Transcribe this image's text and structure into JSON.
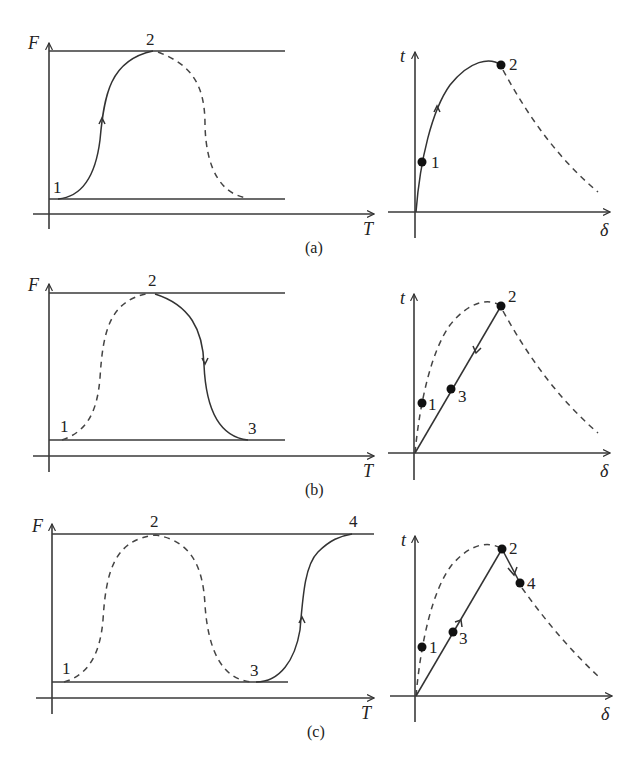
{
  "figure": {
    "panels": [
      {
        "id": "a",
        "caption": "(a)",
        "left_plot": {
          "y_axis_label": "F",
          "x_axis_label": "T",
          "points": [
            "1",
            "2"
          ],
          "solid_path": "1→2 (rising)",
          "dashed_path": "2→falling"
        },
        "right_plot": {
          "y_axis_label": "t",
          "x_axis_label": "δ",
          "points": [
            "1",
            "2"
          ]
        }
      },
      {
        "id": "b",
        "caption": "(b)",
        "left_plot": {
          "y_axis_label": "F",
          "x_axis_label": "T",
          "points": [
            "1",
            "2",
            "3"
          ],
          "solid_path": "2→3 (falling)",
          "dashed_path": "1→2"
        },
        "right_plot": {
          "y_axis_label": "t",
          "x_axis_label": "δ",
          "points": [
            "1",
            "2",
            "3"
          ]
        }
      },
      {
        "id": "c",
        "caption": "(c)",
        "left_plot": {
          "y_axis_label": "F",
          "x_axis_label": "T",
          "points": [
            "1",
            "2",
            "3",
            "4"
          ],
          "solid_path": "3→4 (rising)",
          "dashed_path": "1→2→3"
        },
        "right_plot": {
          "y_axis_label": "t",
          "x_axis_label": "δ",
          "points": [
            "1",
            "2",
            "3",
            "4"
          ]
        }
      }
    ],
    "labels": {
      "F": "F",
      "T": "T",
      "t": "t",
      "delta": "δ",
      "p1": "1",
      "p2": "2",
      "p3": "3",
      "p4": "4",
      "cap_a": "(a)",
      "cap_b": "(b)",
      "cap_c": "(c)"
    },
    "colors": {
      "ink": "#333333",
      "background": "#ffffff"
    }
  }
}
